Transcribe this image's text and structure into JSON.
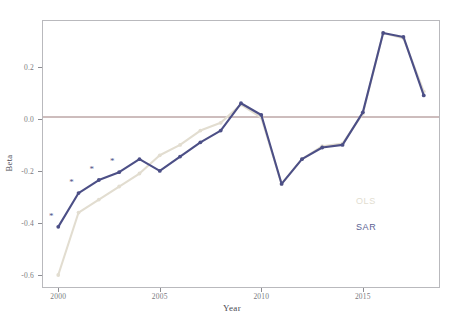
{
  "chart_data": {
    "type": "line",
    "title": "",
    "xlabel": "Year",
    "ylabel": "Beta",
    "x": [
      2000,
      2001,
      2002,
      2003,
      2004,
      2005,
      2006,
      2007,
      2008,
      2009,
      2010,
      2011,
      2012,
      2013,
      2014,
      2015,
      2016,
      2017,
      2018
    ],
    "xlim": [
      1999.2,
      2018.8
    ],
    "ylim": [
      -0.65,
      0.38
    ],
    "xticks": [
      2000,
      2005,
      2010,
      2015
    ],
    "xticklabels": [
      "2000",
      "2005",
      "2010",
      "2015"
    ],
    "yticks": [
      0.2,
      0.0,
      -0.2,
      -0.4,
      -0.6
    ],
    "yticklabels": [
      "0.2",
      "0.0",
      "-0.2",
      "-0.4",
      "-0.6"
    ],
    "grid": false,
    "legend_position": "center-right",
    "reference_line": {
      "y": 0.0,
      "color": "#9b7b7b",
      "label": "zero-line"
    },
    "series": [
      {
        "name": "OLS",
        "color": "#e2ddd0",
        "values": [
          -0.6,
          -0.36,
          -0.31,
          -0.26,
          -0.21,
          -0.14,
          -0.1,
          -0.045,
          -0.015,
          0.055,
          0.005,
          -0.25,
          -0.155,
          -0.105,
          -0.095,
          0.02,
          0.33,
          0.31,
          0.105
        ]
      },
      {
        "name": "SAR",
        "color": "#4c4f86",
        "values": [
          -0.415,
          -0.285,
          -0.235,
          -0.205,
          -0.155,
          -0.2,
          -0.145,
          -0.09,
          -0.045,
          0.06,
          0.015,
          -0.25,
          -0.155,
          -0.11,
          -0.1,
          0.025,
          0.33,
          0.315,
          0.09
        ]
      }
    ],
    "significance_markers": {
      "symbol": "*",
      "series": "SAR",
      "years": [
        2000,
        2001,
        2002,
        2003
      ],
      "values": [
        -0.415,
        -0.285,
        -0.235,
        -0.205
      ]
    }
  },
  "legend": {
    "ols_label": "OLS",
    "sar_label": "SAR"
  },
  "axes": {
    "x_title": "Year",
    "y_title": "Beta"
  }
}
